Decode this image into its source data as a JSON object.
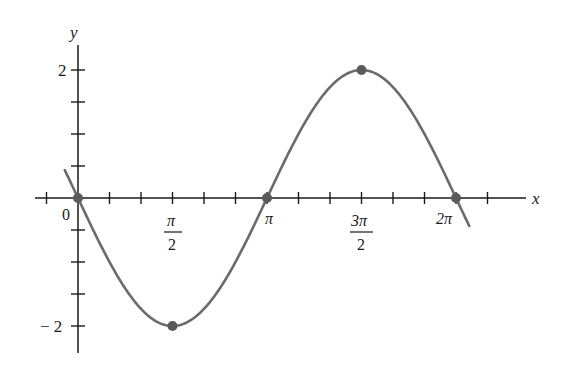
{
  "chart_data": {
    "type": "line",
    "title": "",
    "function": "y = -2 sin x",
    "xlabel": "x",
    "ylabel": "y",
    "xlim": [
      -0.22,
      2.24
    ],
    "xlim_units": "multiples of pi",
    "ylim": [
      -2,
      2
    ],
    "grid": false,
    "legend": null,
    "x_ticks_step": "pi/6",
    "y_ticks_step": 0.5,
    "x_tick_labels": [
      {
        "value": 0,
        "label": "0"
      },
      {
        "value": 0.5,
        "label_num": "π",
        "label_den": "2"
      },
      {
        "value": 1,
        "label": "π"
      },
      {
        "value": 1.5,
        "label_num": "3π",
        "label_den": "2"
      },
      {
        "value": 2,
        "label": "2π"
      }
    ],
    "y_tick_labels": [
      {
        "value": 2,
        "label": "2"
      },
      {
        "value": -2,
        "label": "− 2"
      }
    ],
    "marked_points": [
      {
        "x": "0",
        "y": 0
      },
      {
        "x": "π/2",
        "y": -2
      },
      {
        "x": "π",
        "y": 0
      },
      {
        "x": "3π/2",
        "y": 2
      },
      {
        "x": "2π",
        "y": 0
      }
    ],
    "series": [
      {
        "name": "y = -2 sin x",
        "color": "#6b6b6b",
        "x_start_pi": -0.07,
        "x_end_pi": 2.07
      }
    ]
  },
  "labels": {
    "x_axis": "x",
    "y_axis": "y",
    "origin": "0",
    "pi_half_num": "π",
    "pi_half_den": "2",
    "pi": "π",
    "three_pi_half_num": "3π",
    "three_pi_half_den": "2",
    "two_pi": "2π",
    "y_two": "2",
    "y_neg_two": "− 2"
  },
  "colors": {
    "axis": "#1a1a1a",
    "curve": "#6b6b6b",
    "points": "#5a5a5a"
  }
}
